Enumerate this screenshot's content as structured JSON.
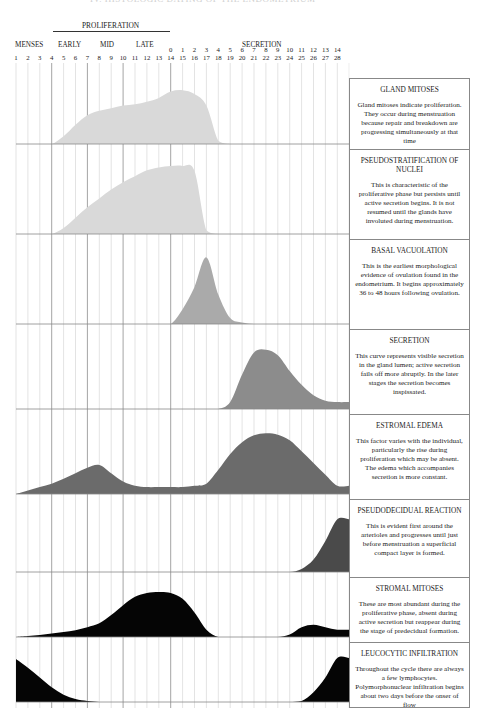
{
  "page_title_clipped": "IV. HISTOLOGIC DATING OF THE ENDOMETRIUM",
  "header": {
    "proliferation_label": "PROLIFERATION",
    "menses_label": "MENSES",
    "early_label": "EARLY",
    "mid_label": "MID",
    "late_label": "LATE",
    "secretion_label": "SECRETION",
    "cycle_days": [
      "1",
      "2",
      "3",
      "4",
      "5",
      "6",
      "7",
      "8",
      "9",
      "10",
      "11",
      "12",
      "13",
      "14",
      "15",
      "16",
      "17",
      "18",
      "19",
      "20",
      "21",
      "22",
      "23",
      "24",
      "25",
      "26",
      "27",
      "28"
    ],
    "postovulation_days": [
      "0",
      "1",
      "2",
      "3",
      "4",
      "5",
      "6",
      "7",
      "8",
      "9",
      "10",
      "11",
      "12",
      "13",
      "14"
    ]
  },
  "panels": [
    {
      "title": "GLAND MITOSES",
      "body": "Gland mitoses indicate proliferation. They occur during menstruation because repair and breakdown are progressing simultaneously at that time",
      "color": "#d9d9d9"
    },
    {
      "title": "PSEUDOSTRATIFICATION OF NUCLEI",
      "body": "This is characteristic of the proliferative phase but persists until active secretion begins. It is not resumed until the glands have involuted during menstruation.",
      "color": "#d9d9d9"
    },
    {
      "title": "BASAL VACUOLATION",
      "body": "This is the earliest morphological evidence of ovulation found in the endometrium. It begins approximately 36 to 48 hours following ovulation.",
      "color": "#aaaaaa"
    },
    {
      "title": "SECRETION",
      "body": "This curve represents visible secretion in the gland lumen; active secretion fails off more abruptly. In the later stages the secretion becomes inspissated.",
      "color": "#8c8c8c"
    },
    {
      "title": "ESTROMAL EDEMA",
      "body": "This factor varies with the individual, particularly the rise during proliferation which may be absent. The edema which accompanies secretion is more constant.",
      "color": "#6b6b6b"
    },
    {
      "title": "PSEUDODECIDUAL REACTION",
      "body": "This is evident first around the arterioles and progresses until just before menstruation a superficial compact layer is formed.",
      "color": "#4a4a4a"
    },
    {
      "title": "STROMAL MITOSES",
      "body": "These are most abundant during the proliferative phase, absent during active secretion but reappear during the stage of predecidual formation.",
      "color": "#050505"
    },
    {
      "title": "LEUCOCYTIC INFILTRATION",
      "body": "Throughout the cycle there are always a few lymphocytes. Polymorphonuclear infiltration begins about two days before the onser of flow",
      "color": "#050505"
    }
  ],
  "chart_data": {
    "type": "area",
    "title": "Histologic dating of the endometrium",
    "xlabel": "Day of cycle",
    "ylabel": "Relative intensity",
    "x": [
      1,
      2,
      3,
      4,
      5,
      6,
      7,
      8,
      9,
      10,
      11,
      12,
      13,
      14,
      15,
      16,
      17,
      18,
      19,
      20,
      21,
      22,
      23,
      24,
      25,
      26,
      27,
      28
    ],
    "ylim": [
      0,
      1
    ],
    "grid": true,
    "series": [
      {
        "name": "Gland mitoses",
        "values": [
          0,
          0,
          0,
          0,
          0.12,
          0.3,
          0.45,
          0.52,
          0.56,
          0.6,
          0.62,
          0.66,
          0.72,
          0.82,
          0.84,
          0.78,
          0.6,
          0.05,
          0,
          0,
          0,
          0,
          0,
          0,
          0,
          0,
          0,
          0
        ]
      },
      {
        "name": "Pseudostratification of nuclei",
        "values": [
          0,
          0,
          0,
          0,
          0.08,
          0.22,
          0.36,
          0.48,
          0.6,
          0.7,
          0.78,
          0.86,
          0.9,
          0.92,
          0.92,
          0.85,
          0.05,
          0,
          0,
          0,
          0,
          0,
          0,
          0,
          0,
          0,
          0,
          0
        ]
      },
      {
        "name": "Basal vacuolation",
        "values": [
          0,
          0,
          0,
          0,
          0,
          0,
          0,
          0,
          0,
          0,
          0,
          0,
          0,
          0,
          0.2,
          0.5,
          0.9,
          0.4,
          0.08,
          0.02,
          0,
          0,
          0,
          0,
          0,
          0,
          0,
          0
        ]
      },
      {
        "name": "Secretion",
        "values": [
          0,
          0,
          0,
          0,
          0,
          0,
          0,
          0,
          0,
          0,
          0,
          0,
          0,
          0,
          0,
          0,
          0,
          0,
          0.1,
          0.5,
          0.82,
          0.86,
          0.78,
          0.55,
          0.35,
          0.2,
          0.12,
          0.1
        ]
      },
      {
        "name": "Stromal edema",
        "values": [
          0,
          0.05,
          0.1,
          0.15,
          0.22,
          0.3,
          0.38,
          0.42,
          0.3,
          0.18,
          0.12,
          0.1,
          0.1,
          0.1,
          0.1,
          0.12,
          0.15,
          0.35,
          0.58,
          0.75,
          0.85,
          0.88,
          0.86,
          0.78,
          0.62,
          0.45,
          0.28,
          0.12
        ]
      },
      {
        "name": "Pseudodecidual reaction",
        "values": [
          0,
          0,
          0,
          0,
          0,
          0,
          0,
          0,
          0,
          0,
          0,
          0,
          0,
          0,
          0,
          0,
          0,
          0,
          0,
          0,
          0,
          0,
          0,
          0,
          0.05,
          0.2,
          0.5,
          0.85
        ]
      },
      {
        "name": "Stromal mitoses",
        "values": [
          0,
          0.02,
          0.04,
          0.07,
          0.1,
          0.14,
          0.2,
          0.28,
          0.45,
          0.65,
          0.82,
          0.9,
          0.92,
          0.9,
          0.78,
          0.5,
          0.15,
          0,
          0,
          0,
          0,
          0,
          0,
          0.05,
          0.2,
          0.25,
          0.2,
          0.15
        ]
      },
      {
        "name": "Leucocytic infiltration",
        "values": [
          0.88,
          0.7,
          0.5,
          0.3,
          0.15,
          0.06,
          0.02,
          0,
          0,
          0,
          0,
          0,
          0,
          0,
          0,
          0,
          0,
          0,
          0,
          0,
          0,
          0,
          0,
          0,
          0.02,
          0.2,
          0.5,
          0.9
        ]
      }
    ]
  }
}
